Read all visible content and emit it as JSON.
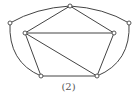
{
  "figure": {
    "caption": "(2)",
    "stroke_color": "#444444",
    "vertex_fill": "#ffffff",
    "vertices": [
      {
        "id": "top",
        "x": 70,
        "y": 6
      },
      {
        "id": "outer-left",
        "x": 10,
        "y": 23
      },
      {
        "id": "outer-right",
        "x": 129,
        "y": 23
      },
      {
        "id": "inner-left",
        "x": 25,
        "y": 33
      },
      {
        "id": "inner-right",
        "x": 114,
        "y": 33
      },
      {
        "id": "bottom-left",
        "x": 41,
        "y": 76
      },
      {
        "id": "bottom-right",
        "x": 97,
        "y": 76
      }
    ],
    "straight_edges": [
      [
        "top",
        "inner-left"
      ],
      [
        "top",
        "inner-right"
      ],
      [
        "inner-left",
        "inner-right"
      ],
      [
        "inner-left",
        "bottom-left"
      ],
      [
        "inner-left",
        "bottom-right"
      ],
      [
        "inner-right",
        "bottom-right"
      ],
      [
        "bottom-left",
        "bottom-right"
      ]
    ],
    "curved_edges": [
      {
        "from": "outer-left",
        "to": "top",
        "cx": 36,
        "cy": 8
      },
      {
        "from": "top",
        "to": "outer-right",
        "cx": 104,
        "cy": 8
      },
      {
        "from": "outer-left",
        "to": "bottom-left",
        "cx": 8,
        "cy": 62
      },
      {
        "from": "outer-right",
        "to": "bottom-right",
        "cx": 131,
        "cy": 62
      }
    ]
  }
}
